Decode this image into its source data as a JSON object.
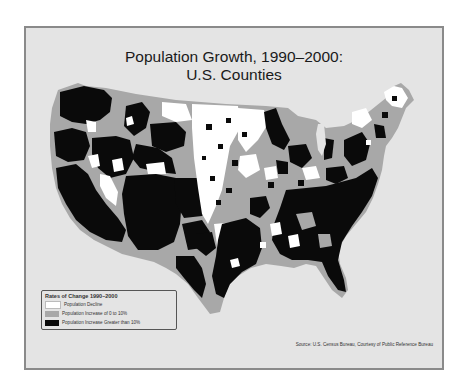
{
  "title": {
    "line1": "Population Growth, 1990–2000:",
    "line2": "U.S. Counties"
  },
  "legend": {
    "title": "Rates of Change 1990–2000",
    "items": [
      {
        "label": "Population Decline",
        "color": "#ffffff"
      },
      {
        "label": "Population Increase of 0 to 10%",
        "color": "#a8a8a8"
      },
      {
        "label": "Population Increase Greater than 10%",
        "color": "#0a0a0a"
      }
    ]
  },
  "source": "Source: U.S. Census Bureau, Courtesy of Public Reference Bureau",
  "colors": {
    "background": "#e4e4e4",
    "frame_border": "#8a8a8a",
    "decline": "#ffffff",
    "moderate_increase": "#a8a8a8",
    "high_increase": "#0a0a0a"
  }
}
